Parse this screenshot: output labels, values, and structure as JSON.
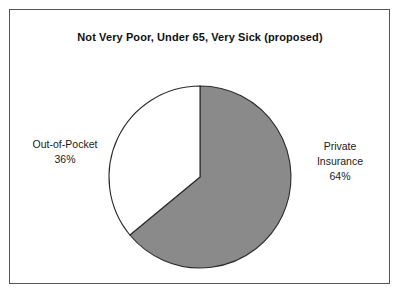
{
  "figure": {
    "title": "Not Very Poor, Under 65, Very Sick (proposed)",
    "border_color": "#555555",
    "background": "#ffffff"
  },
  "labels": {
    "left": {
      "name": "Out-of-Pocket",
      "percent": "36%"
    },
    "right": {
      "name_line1": "Private",
      "name_line2": "Insurance",
      "percent": "64%"
    }
  },
  "chart_data": {
    "type": "pie",
    "title": "Not Very Poor, Under 65, Very Sick (proposed)",
    "xlabel": "",
    "ylabel": "",
    "labels": [
      "Private Insurance",
      "Out-of-Pocket"
    ],
    "values": [
      64,
      36
    ],
    "value_labels": [
      "64%",
      "36%"
    ],
    "units": "percent",
    "total": 100,
    "colors": [
      "#8a8a8a",
      "#ffffff"
    ],
    "edge_color": "#2b2b2b",
    "start_angle_deg": 90,
    "direction": "clockwise",
    "legend": "none",
    "grid": false,
    "annotations": [
      {
        "text": "Out-of-Pocket",
        "position": "left"
      },
      {
        "text": "36%",
        "position": "left"
      },
      {
        "text": "Private",
        "position": "right"
      },
      {
        "text": "Insurance",
        "position": "right"
      },
      {
        "text": "64%",
        "position": "right"
      }
    ]
  }
}
